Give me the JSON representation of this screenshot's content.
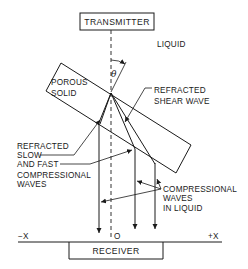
{
  "diagram": {
    "boxes": {
      "transmitter": "TRANSMITTER",
      "receiver": "RECEIVER",
      "porous_solid": "POROUS SOLID"
    },
    "labels": {
      "liquid": "LIQUID",
      "theta": "θ",
      "refracted_shear_wave": [
        "REFRACTED",
        "SHEAR WAVE"
      ],
      "refracted_slow_fast": [
        "REFRACTED",
        "SLOW",
        "AND FAST",
        "COMPRESSIONAL",
        "WAVES"
      ],
      "compressional_in_liquid": [
        "COMPRESSIONAL",
        "WAVES",
        "IN LIQUID"
      ]
    },
    "axis": {
      "neg_x": "−X",
      "origin": "O",
      "pos_x": "+X"
    },
    "porous_solid_lines": [
      "POROUS",
      "SOLID"
    ]
  }
}
